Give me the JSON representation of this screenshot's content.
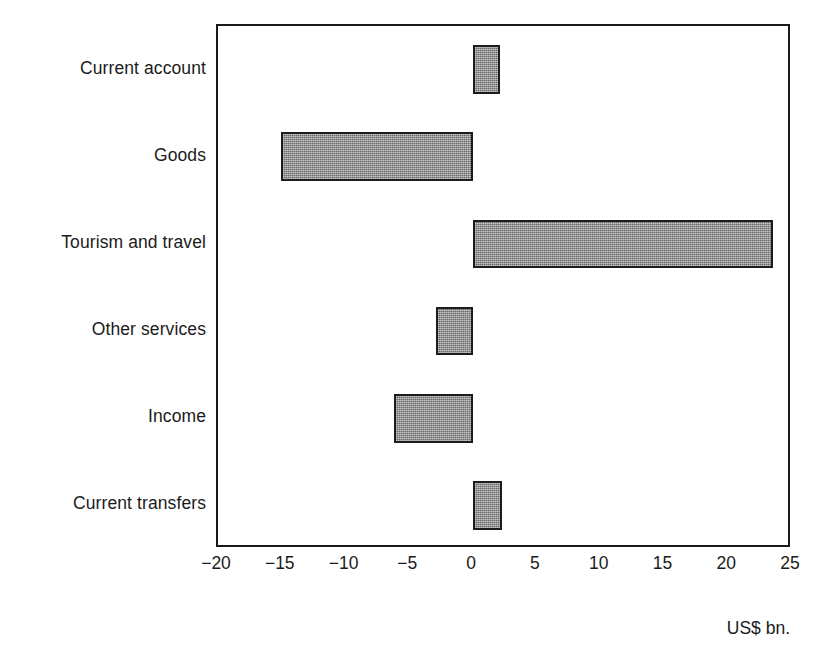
{
  "chart": {
    "unit_caption": "US$ bn."
  },
  "chart_data": {
    "type": "bar",
    "orientation": "horizontal",
    "title": "",
    "subtitle": "",
    "xlabel": "US$ bn.",
    "ylabel": "",
    "categories": [
      "Current account",
      "Goods",
      "Tourism and travel",
      "Other services",
      "Income",
      "Current transfers"
    ],
    "values": [
      2.1,
      -15.1,
      23.5,
      -2.9,
      -6.2,
      2.3
    ],
    "xlim": [
      -20,
      25
    ],
    "xticks": [
      -20,
      -15,
      -10,
      -5,
      0,
      5,
      10,
      15,
      20,
      25
    ],
    "xtick_labels": [
      "−20",
      "−15",
      "−10",
      "−5",
      "0",
      "5",
      "10",
      "15",
      "20",
      "25"
    ],
    "grid": false,
    "legend": null,
    "bar_fill_color": "#8a8a8a",
    "bar_border_color": "#1c1c1c",
    "frame_color": "#1a1a1a",
    "background_color": "#ffffff"
  }
}
